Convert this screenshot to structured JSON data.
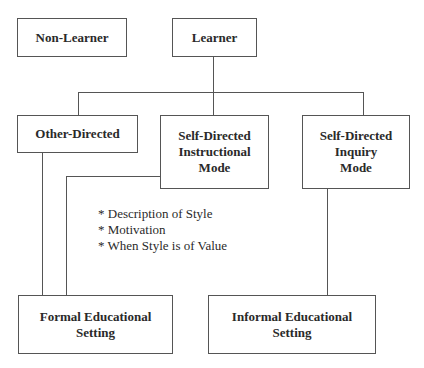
{
  "diagram": {
    "nodes": {
      "non_learner": {
        "label": "Non-Learner"
      },
      "learner": {
        "label": "Learner"
      },
      "other_directed": {
        "label": "Other-Directed"
      },
      "self_directed_instructional": {
        "lines": [
          "Self-Directed",
          "Instructional",
          "Mode"
        ]
      },
      "self_directed_inquiry": {
        "lines": [
          "Self-Directed",
          "Inquiry",
          "Mode"
        ]
      },
      "formal_setting": {
        "lines": [
          "Formal Educational",
          "Setting"
        ]
      },
      "informal_setting": {
        "lines": [
          "Informal Educational",
          "Setting"
        ]
      }
    },
    "notes": [
      "* Description of Style",
      "* Motivation",
      "* When Style is of Value"
    ],
    "edges": [
      {
        "from": "learner",
        "to": "other_directed"
      },
      {
        "from": "learner",
        "to": "self_directed_instructional"
      },
      {
        "from": "learner",
        "to": "self_directed_inquiry"
      },
      {
        "from": "other_directed",
        "to": "formal_setting"
      },
      {
        "from": "self_directed_instructional",
        "to": "formal_setting"
      },
      {
        "from": "self_directed_inquiry",
        "to": "informal_setting"
      }
    ]
  }
}
